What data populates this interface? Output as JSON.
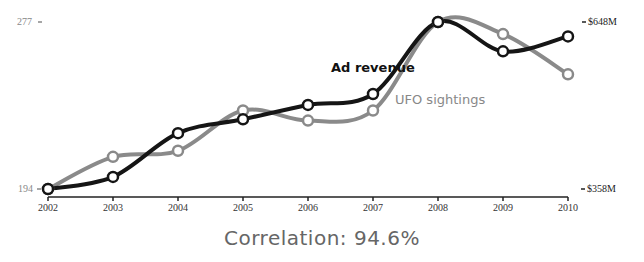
{
  "chart_data": {
    "type": "line",
    "title": "",
    "categories": [
      "2002",
      "2003",
      "2004",
      "2005",
      "2006",
      "2007",
      "2008",
      "2009",
      "2010"
    ],
    "series": [
      {
        "name": "Ad revenue",
        "axis": "right",
        "color": "#111111",
        "values": [
          358,
          379,
          455,
          479,
          504,
          523,
          648,
          597,
          623
        ]
      },
      {
        "name": "UFO sightings",
        "axis": "left",
        "color": "#888888",
        "values": [
          194,
          210,
          213,
          233,
          228,
          233,
          277,
          271,
          251
        ]
      }
    ],
    "left_axis": {
      "ticks": [
        "194",
        "277"
      ],
      "range": [
        194,
        277
      ]
    },
    "right_axis": {
      "ticks": [
        "$358M",
        "$648M"
      ],
      "range": [
        358,
        648
      ]
    },
    "xlabel": "",
    "grid": false,
    "annotation": "Correlation: 94.6%"
  },
  "labels": {
    "ad_revenue": "Ad revenue",
    "ufo_sightings": "UFO sightings",
    "correlation": "Correlation: 94.6%",
    "left_top": "277",
    "left_bottom": "194",
    "right_top": "$648M",
    "right_bottom": "$358M"
  }
}
